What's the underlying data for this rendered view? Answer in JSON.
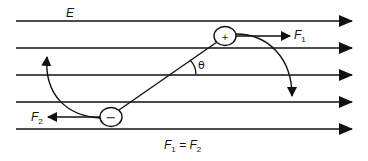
{
  "diagram": {
    "field": {
      "label": "E",
      "line_count": 5,
      "direction": "right",
      "line_y": [
        21,
        48,
        75,
        102,
        129
      ]
    },
    "charges": [
      {
        "id": "positive",
        "symbol": "+",
        "cx": 225,
        "cy": 36
      },
      {
        "id": "negative",
        "symbol": "−",
        "cx": 111,
        "cy": 117
      }
    ],
    "forces": {
      "f1": {
        "label_main": "F",
        "label_sub": "1",
        "direction": "right"
      },
      "f2": {
        "label_main": "F",
        "label_sub": "2",
        "direction": "left"
      }
    },
    "angle_label": "θ",
    "equation": {
      "lhs_main": "F",
      "lhs_sub": "1",
      "eq": " = ",
      "rhs_main": "F",
      "rhs_sub": "2"
    },
    "rotation_arrows": [
      {
        "id": "rotation-positive",
        "direction": "clockwise-down"
      },
      {
        "id": "rotation-negative",
        "direction": "clockwise-up"
      }
    ],
    "colors": {
      "stroke": "#111111",
      "background": "#ffffff"
    }
  }
}
